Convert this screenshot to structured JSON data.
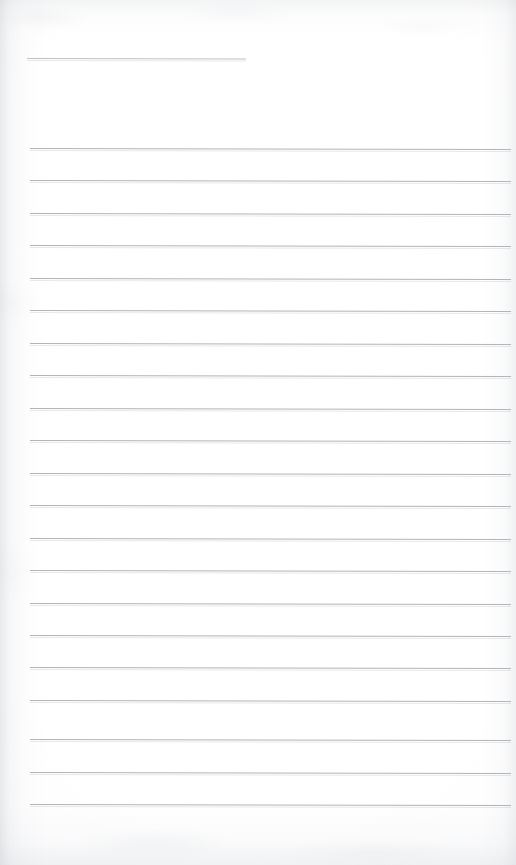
{
  "document": {
    "kind": "lined-notebook-page",
    "title": "",
    "content_text": "",
    "page_width": 516,
    "page_height": 865,
    "paper_color": "#fdfdfd",
    "rule_color": "#b0b4ba",
    "header_rule_color": "#bcc0c5",
    "vignette_color": "#b4b8be"
  },
  "header_rule": {
    "label": "header-rule",
    "x": 27,
    "y": 58,
    "width": 219,
    "written_text": ""
  },
  "body_rules": {
    "count": 21,
    "left": 30,
    "right_edge": 511,
    "first_y": 148,
    "spacing": 32.4,
    "lines": [
      {
        "index": 1,
        "y": 148,
        "written_text": ""
      },
      {
        "index": 2,
        "y": 180,
        "written_text": ""
      },
      {
        "index": 3,
        "y": 213,
        "written_text": ""
      },
      {
        "index": 4,
        "y": 245,
        "written_text": ""
      },
      {
        "index": 5,
        "y": 278,
        "written_text": ""
      },
      {
        "index": 6,
        "y": 310,
        "written_text": ""
      },
      {
        "index": 7,
        "y": 343,
        "written_text": ""
      },
      {
        "index": 8,
        "y": 375,
        "written_text": ""
      },
      {
        "index": 9,
        "y": 408,
        "written_text": ""
      },
      {
        "index": 10,
        "y": 440,
        "written_text": ""
      },
      {
        "index": 11,
        "y": 473,
        "written_text": ""
      },
      {
        "index": 12,
        "y": 505,
        "written_text": ""
      },
      {
        "index": 13,
        "y": 538,
        "written_text": ""
      },
      {
        "index": 14,
        "y": 570,
        "written_text": ""
      },
      {
        "index": 15,
        "y": 603,
        "written_text": ""
      },
      {
        "index": 16,
        "y": 635,
        "written_text": ""
      },
      {
        "index": 17,
        "y": 667,
        "written_text": ""
      },
      {
        "index": 18,
        "y": 700,
        "written_text": ""
      },
      {
        "index": 19,
        "y": 739,
        "written_text": ""
      },
      {
        "index": 20,
        "y": 772,
        "written_text": ""
      },
      {
        "index": 21,
        "y": 804,
        "written_text": ""
      }
    ]
  }
}
